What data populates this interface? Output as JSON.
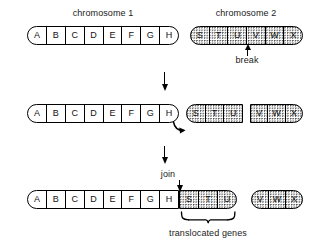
{
  "diagram": {
    "title_top_left": "chromosome 1",
    "title_top_right": "chromosome 2",
    "break_label": "break",
    "join_label": "join",
    "translocated_label": "translocated genes",
    "colors": {
      "line": "#000000",
      "background": "#ffffff",
      "stipple": "#4a4a4a",
      "text": "#1a1a1a"
    }
  },
  "rows": {
    "row1": {
      "chromosome1": {
        "genes": [
          "A",
          "B",
          "C",
          "D",
          "E",
          "F",
          "G",
          "H"
        ],
        "fill": "plain",
        "caps": "both"
      },
      "chromosome2": {
        "genes": [
          "S",
          "T",
          "U",
          "V",
          "W",
          "X"
        ],
        "fill": "stipple",
        "caps": "both",
        "break_after_gene": "U"
      }
    },
    "row2": {
      "chromosome1": {
        "genes": [
          "A",
          "B",
          "C",
          "D",
          "E",
          "F",
          "G",
          "H"
        ],
        "fill": "plain",
        "caps": "both"
      },
      "fragment_stu": {
        "genes": [
          "S",
          "T",
          "U"
        ],
        "fill": "stipple",
        "caps": "left"
      },
      "fragment_vwx": {
        "genes": [
          "V",
          "W",
          "X"
        ],
        "fill": "stipple",
        "caps": "right"
      }
    },
    "row3": {
      "translocated_chromosome": {
        "genes_host": [
          "A",
          "B",
          "C",
          "D",
          "E",
          "F",
          "G",
          "H"
        ],
        "genes_translocated": [
          "S",
          "T",
          "U"
        ],
        "fill_host": "plain",
        "fill_translocated": "stipple"
      },
      "fragment_vwx": {
        "genes": [
          "V",
          "W",
          "X"
        ],
        "fill": "stipple",
        "caps": "both"
      }
    }
  },
  "gene_letters": {
    "a": "A",
    "b": "B",
    "c": "C",
    "d": "D",
    "e": "E",
    "f": "F",
    "g": "G",
    "h": "H",
    "s": "S",
    "t": "T",
    "u": "U",
    "v": "V",
    "w": "W",
    "x": "X"
  }
}
